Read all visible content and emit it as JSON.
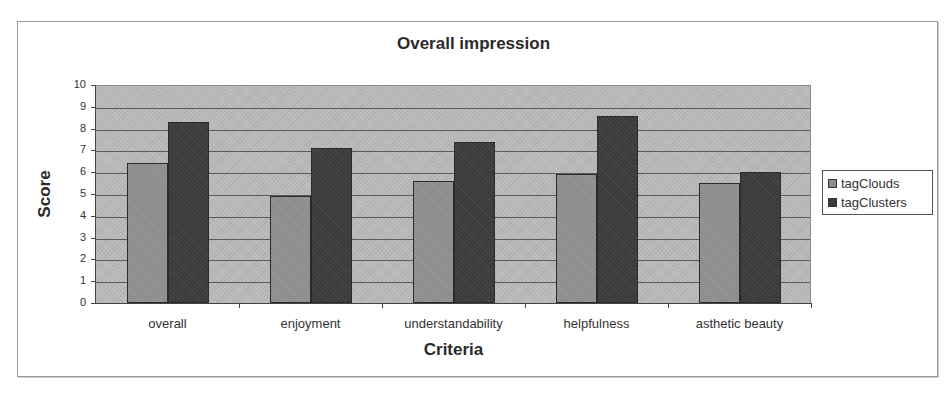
{
  "chart_data": {
    "type": "bar",
    "title": "Overall impression",
    "xlabel": "Criteria",
    "ylabel": "Score",
    "categories": [
      "overall",
      "enjoyment",
      "understandability",
      "helpfulness",
      "asthetic beauty"
    ],
    "series": [
      {
        "name": "tagClouds",
        "values": [
          6.4,
          4.9,
          5.6,
          5.9,
          5.5
        ],
        "color": "#8d8d8d"
      },
      {
        "name": "tagClusters",
        "values": [
          8.3,
          7.1,
          7.4,
          8.6,
          6.0
        ],
        "color": "#3b3b3b"
      }
    ],
    "ylim": [
      0,
      10
    ],
    "yticks": [
      0,
      1,
      2,
      3,
      4,
      5,
      6,
      7,
      8,
      9,
      10
    ],
    "grid": true,
    "legend_position": "right",
    "plot_background": "#b9b9b9"
  }
}
